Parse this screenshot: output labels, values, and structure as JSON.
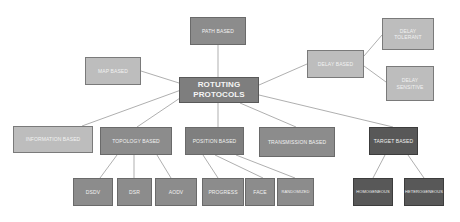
{
  "diagram": {
    "root": {
      "label": "ROTUTING PROTOCOLS",
      "line1": "ROTUTING",
      "line2": "PROTOCOLS"
    },
    "colors": {
      "light": "#bdbdbd",
      "mid": "#8c8c8c",
      "dark": "#585858",
      "root": "#7e7e7e",
      "line": "#a6a6a6",
      "text": "#f2f2f2"
    },
    "nodes": {
      "path_based": "PATH BASED",
      "map_based": "MAP BASED",
      "delay_based": "DELAY BASED",
      "delay_tolerant_1": "DELAY",
      "delay_tolerant_2": "TOLERANT",
      "delay_sensitive_1": "DELAY",
      "delay_sensitive_2": "SENSITIVE",
      "information_based": "INFORMATION BASED",
      "topology_based": "TOPOLOGY BASED",
      "position_based": "POSITION BASED",
      "transmission_based": "TRANSMISSION BASED",
      "target_based": "TARGET BASED",
      "dsdv": "DSDV",
      "dsr": "DSR",
      "aodv": "AODV",
      "progress": "PROGRESS",
      "face": "FACE",
      "randomized": "RANDOMIZED",
      "homogeneous": "HOMOGENEOUS",
      "heterogeneous": "HETEROGENEOUS"
    },
    "edges": [
      [
        "ROTUTING PROTOCOLS",
        "PATH BASED"
      ],
      [
        "ROTUTING PROTOCOLS",
        "MAP BASED"
      ],
      [
        "ROTUTING PROTOCOLS",
        "DELAY BASED"
      ],
      [
        "DELAY BASED",
        "DELAY TOLERANT"
      ],
      [
        "DELAY BASED",
        "DELAY SENSITIVE"
      ],
      [
        "ROTUTING PROTOCOLS",
        "INFORMATION BASED"
      ],
      [
        "ROTUTING PROTOCOLS",
        "TOPOLOGY BASED"
      ],
      [
        "ROTUTING PROTOCOLS",
        "POSITION BASED"
      ],
      [
        "ROTUTING PROTOCOLS",
        "TRANSMISSION BASED"
      ],
      [
        "ROTUTING PROTOCOLS",
        "TARGET BASED"
      ],
      [
        "TOPOLOGY BASED",
        "DSDV"
      ],
      [
        "TOPOLOGY BASED",
        "DSR"
      ],
      [
        "TOPOLOGY BASED",
        "AODV"
      ],
      [
        "POSITION BASED",
        "PROGRESS"
      ],
      [
        "POSITION BASED",
        "FACE"
      ],
      [
        "POSITION BASED",
        "RANDOMIZED"
      ],
      [
        "TARGET BASED",
        "HOMOGENEOUS"
      ],
      [
        "TARGET BASED",
        "HETEROGENEOUS"
      ]
    ]
  }
}
